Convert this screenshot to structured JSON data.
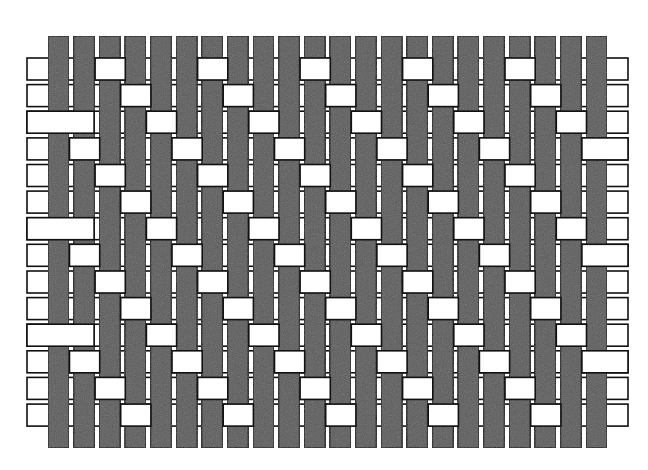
{
  "diagram": {
    "type": "weave-interlacing",
    "rows": 14,
    "cols": 22,
    "weave": {
      "name": "3/1 twill",
      "repeat": 4,
      "weft_over_rule": "row % 4 == (col + 2) % 4",
      "offset": 2
    },
    "geometry": {
      "warp_x0": 48,
      "warp_pitch": 25.62,
      "warp_width": 21,
      "warp_top": 36,
      "warp_bottom": 448,
      "weft_y0": 58,
      "weft_pitch": 26.62,
      "weft_height": 22,
      "weft_left": 27,
      "weft_right": 628
    },
    "colors": {
      "warp_fill": "#5b5b5b",
      "weft_fill": "#ffffff",
      "stroke": "#111111",
      "background": "#ffffff"
    }
  }
}
